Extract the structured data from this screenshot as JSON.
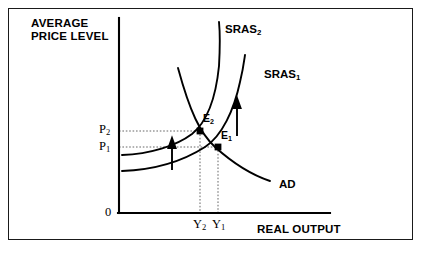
{
  "diagram": {
    "type": "AD-SRAS macroeconomic equilibrium diagram",
    "axes": {
      "y_axis_title_line1": "AVERAGE",
      "y_axis_title_line2": "PRICE LEVEL",
      "x_axis_title": "REAL OUTPUT",
      "origin_label": "0"
    },
    "price_ticks": [
      {
        "name": "P2",
        "text": "P",
        "sub": "2",
        "value": "P₂"
      },
      {
        "name": "P1",
        "text": "P",
        "sub": "1",
        "value": "P₁"
      }
    ],
    "output_ticks": [
      {
        "name": "Y2",
        "text": "Y",
        "sub": "2",
        "value": "Y₂"
      },
      {
        "name": "Y1",
        "text": "Y",
        "sub": "1",
        "value": "Y₁"
      }
    ],
    "curves": [
      {
        "name": "SRAS2",
        "text": "SRAS",
        "sub": "2",
        "label": "SRAS₂"
      },
      {
        "name": "SRAS1",
        "text": "SRAS",
        "sub": "1",
        "label": "SRAS₁"
      },
      {
        "name": "AD",
        "text": "AD",
        "sub": "",
        "label": "AD"
      }
    ],
    "equilibria": [
      {
        "name": "E2",
        "text": "E",
        "sub": "2",
        "label": "E₂"
      },
      {
        "name": "E1",
        "text": "E",
        "sub": "1",
        "label": "E₁"
      }
    ],
    "colors": {
      "ink": "#000000",
      "background": "#ffffff",
      "border": "#1a1a1a",
      "guide": "#555555"
    }
  }
}
